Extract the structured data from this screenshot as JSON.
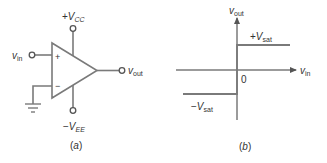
{
  "colors": {
    "line": "#7a7a7a",
    "text": "#333333",
    "background": "#ffffff"
  },
  "panel_a": {
    "caption": "(a)",
    "caption_letter": "a",
    "vcc_label": {
      "sign": "+",
      "main": "V",
      "sub": "CC"
    },
    "vee_label": {
      "sign": "−",
      "main": "V",
      "sub": "EE"
    },
    "vin_label": {
      "main": "v",
      "sub": "in"
    },
    "vout_label": {
      "main": "v",
      "sub": "out"
    },
    "plus_symbol": "+",
    "minus_symbol": "−",
    "components": [
      "op-amp",
      "positive-supply-terminal",
      "negative-supply-terminal",
      "input-terminal",
      "output-terminal",
      "ground"
    ]
  },
  "panel_b": {
    "caption": "(b)",
    "caption_letter": "b",
    "y_axis_label": {
      "main": "v",
      "sub": "out"
    },
    "x_axis_label": {
      "main": "v",
      "sub": "in"
    },
    "origin_label": "0",
    "pos_sat_label": {
      "sign": "+",
      "main": "V",
      "sub": "sat"
    },
    "neg_sat_label": {
      "sign": "−",
      "main": "V",
      "sub": "sat"
    },
    "transfer_curve": {
      "description": "Ideal comparator transfer characteristic: output equals -Vsat for vin < 0 and +Vsat for vin > 0",
      "segments": [
        {
          "x_range": "vin < 0",
          "y": "-Vsat"
        },
        {
          "x_range": "vin > 0",
          "y": "+Vsat"
        }
      ]
    }
  }
}
